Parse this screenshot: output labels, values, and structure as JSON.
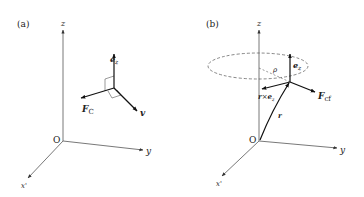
{
  "panels": [
    {
      "id": "a",
      "label": "(a)",
      "origin_label": "O",
      "axes": {
        "z": "z",
        "y": "y",
        "x": "x'"
      },
      "vectors": {
        "ez": {
          "base": "e",
          "sub": "z"
        },
        "fc": {
          "base": "F",
          "sub": "C"
        },
        "v": {
          "base": "v"
        }
      }
    },
    {
      "id": "b",
      "label": "(b)",
      "origin_label": "O",
      "axes": {
        "z": "z",
        "y": "y",
        "x": "x'"
      },
      "circle_radius_label": "ρ",
      "vectors": {
        "ez": {
          "base": "e",
          "sub": "z"
        },
        "fcf": {
          "base": "F",
          "sub": "cf"
        },
        "r": {
          "base": "r"
        },
        "rxez": {
          "base": "r",
          "op": "×",
          "base2": "e",
          "sub": "z"
        }
      }
    }
  ],
  "colors": {
    "line": "#333333",
    "text": "#222222",
    "background": "#ffffff"
  }
}
